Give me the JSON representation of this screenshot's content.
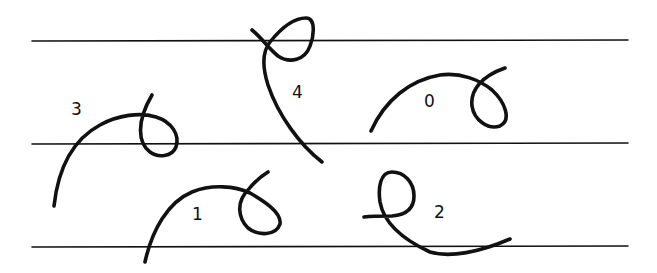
{
  "diagram": {
    "colors": {
      "stroke": "#111111",
      "background": "#ffffff"
    },
    "guide_lines": [
      {
        "y": 41,
        "x1": 32,
        "x2": 628
      },
      {
        "y": 144,
        "x1": 32,
        "x2": 628
      },
      {
        "y": 247,
        "x1": 32,
        "x2": 628
      }
    ],
    "strokes": [
      {
        "id": "0",
        "label": "0",
        "label_pos": {
          "x": 424,
          "y": 93
        }
      },
      {
        "id": "1",
        "label": "1",
        "label_pos": {
          "x": 192,
          "y": 206
        }
      },
      {
        "id": "2",
        "label": "2",
        "label_pos": {
          "x": 434,
          "y": 204
        }
      },
      {
        "id": "3",
        "label": "3",
        "label_pos": {
          "x": 71,
          "y": 101
        }
      },
      {
        "id": "4",
        "label": "4",
        "label_pos": {
          "x": 292,
          "y": 84
        }
      }
    ]
  }
}
